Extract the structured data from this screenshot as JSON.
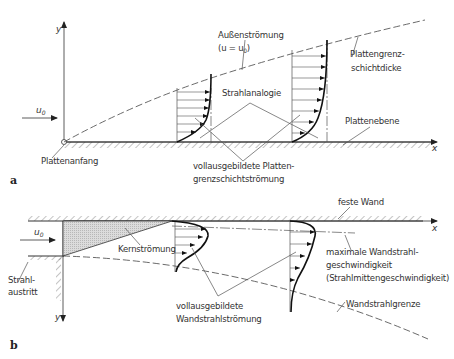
{
  "panel_a": {
    "label": "a",
    "axis_y": "y",
    "axis_x": "x",
    "u0": "u",
    "u0_sub": "0",
    "aussenstroemung_1": "Außenströmung",
    "aussenstroemung_2a": "(u = u",
    "aussenstroemung_2sub": "0",
    "aussenstroemung_2b": ")",
    "grenzschichtdicke_1": "Plattengrenz-",
    "grenzschichtdicke_2": "schichtdicke",
    "strahlanalogie": "Strahlanalogie",
    "plattenebene": "Plattenebene",
    "plattenanfang": "Plattenanfang",
    "voll_1": "vollausgebildete Platten-",
    "voll_2": "grenzschichtströmung"
  },
  "panel_b": {
    "label": "b",
    "axis_y": "y",
    "axis_x": "x",
    "u0": "u",
    "u0_sub": "0",
    "feste_wand": "feste Wand",
    "kernstroemung": "Kernströmung",
    "strahlaustritt_1": "Strahl-",
    "strahlaustritt_2": "austritt",
    "max_1": "maximale Wandstrahl-",
    "max_2": "geschwindigkeit",
    "max_3": "(Strahlmittengeschwindigkeit)",
    "wandstrahlgrenze": "Wandstrahlgrenze",
    "voll_1": "vollausgebildete",
    "voll_2": "Wandstrahlströmung"
  }
}
